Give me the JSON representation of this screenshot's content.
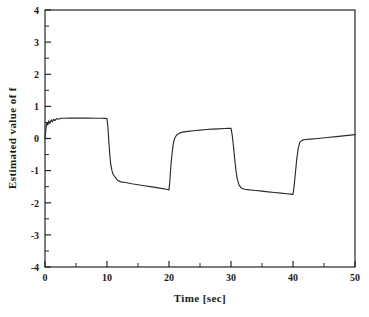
{
  "chart_data": {
    "type": "line",
    "title": "",
    "xlabel": "Time [sec]",
    "ylabel": "Estimated value of  f",
    "xlim": [
      0,
      50
    ],
    "ylim": [
      -4,
      4
    ],
    "xticks": [
      0,
      10,
      20,
      30,
      40,
      50
    ],
    "yticks": [
      -4,
      -3,
      -2,
      -1,
      0,
      1,
      2,
      3,
      4
    ],
    "xtick_labels": [
      "0",
      "10",
      "20",
      "30",
      "40",
      "50"
    ],
    "ytick_labels": [
      "-4",
      "-3",
      "-2",
      "-1",
      "0",
      "1",
      "2",
      "3",
      "4"
    ],
    "minor_ticks": true,
    "grid": false,
    "legend": null,
    "legend_position": "none",
    "line_color": "#2b2b2b",
    "frame_color": "#262626",
    "background_color": "#ffffff",
    "series": [
      {
        "name": "Estimated value of f",
        "x": [
          0.0,
          0.15,
          0.3,
          0.45,
          0.6,
          0.8,
          1.0,
          1.2,
          1.4,
          1.6,
          1.9,
          2.2,
          2.6,
          3.2,
          4.0,
          5.0,
          6.0,
          7.0,
          8.0,
          9.0,
          9.7,
          10.0,
          10.15,
          10.3,
          10.45,
          10.6,
          10.8,
          11.0,
          11.3,
          11.7,
          12.2,
          13.0,
          14.0,
          15.0,
          16.0,
          17.0,
          18.0,
          19.0,
          19.6,
          20.0,
          20.15,
          20.3,
          20.5,
          20.7,
          20.9,
          21.2,
          21.6,
          22.2,
          23.0,
          24.0,
          25.0,
          26.0,
          27.0,
          28.0,
          29.0,
          29.6,
          30.0,
          30.2,
          30.4,
          30.6,
          30.8,
          31.0,
          31.3,
          31.7,
          32.2,
          33.0,
          34.0,
          35.0,
          36.0,
          37.0,
          38.0,
          39.0,
          39.6,
          40.0,
          40.2,
          40.4,
          40.6,
          40.85,
          41.1,
          41.5,
          42.0,
          42.8,
          44.0,
          45.5,
          47.0,
          48.5,
          50.0
        ],
        "y": [
          0.0,
          0.3,
          0.5,
          0.42,
          0.55,
          0.47,
          0.58,
          0.52,
          0.6,
          0.56,
          0.62,
          0.6,
          0.63,
          0.63,
          0.635,
          0.635,
          0.635,
          0.635,
          0.63,
          0.63,
          0.625,
          0.62,
          0.35,
          -0.1,
          -0.5,
          -0.8,
          -1.0,
          -1.12,
          -1.2,
          -1.3,
          -1.35,
          -1.37,
          -1.41,
          -1.44,
          -1.47,
          -1.5,
          -1.53,
          -1.56,
          -1.58,
          -1.6,
          -1.3,
          -0.85,
          -0.45,
          -0.15,
          0.0,
          0.1,
          0.16,
          0.2,
          0.22,
          0.24,
          0.26,
          0.28,
          0.29,
          0.3,
          0.31,
          0.315,
          0.32,
          0.1,
          -0.25,
          -0.65,
          -1.0,
          -1.25,
          -1.45,
          -1.55,
          -1.58,
          -1.6,
          -1.62,
          -1.64,
          -1.66,
          -1.68,
          -1.7,
          -1.72,
          -1.73,
          -1.74,
          -1.45,
          -1.05,
          -0.65,
          -0.3,
          -0.12,
          -0.05,
          -0.03,
          -0.02,
          0.0,
          0.03,
          0.06,
          0.09,
          0.12
        ]
      }
    ],
    "annotations": []
  },
  "axes": {
    "x_title": "Time [sec]",
    "y_title": "Estimated value of  f"
  }
}
